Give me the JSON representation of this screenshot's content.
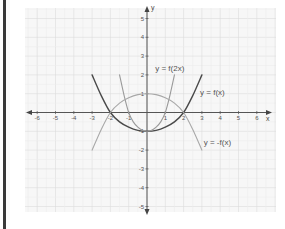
{
  "chart_data": {
    "type": "line",
    "title": "",
    "xlabel": "x",
    "ylabel": "y",
    "xlim": [
      -6.5,
      6.7
    ],
    "ylim": [
      -5.4,
      5.6
    ],
    "grid": true,
    "x_ticks": [
      -6,
      -5,
      -4,
      -3,
      -2,
      -1,
      1,
      2,
      3,
      4,
      5,
      6
    ],
    "y_ticks": [
      -5,
      -4,
      -3,
      -2,
      -1,
      1,
      2,
      3,
      4,
      5
    ],
    "series": [
      {
        "name": "y = f(x)",
        "color": "#4a4a4a",
        "width": 1.4,
        "points": [
          [
            -3,
            2
          ],
          [
            -2.5,
            0.9
          ],
          [
            -2,
            0
          ],
          [
            -1.5,
            -0.5
          ],
          [
            -1,
            -0.78
          ],
          [
            -0.5,
            -0.95
          ],
          [
            0,
            -1
          ],
          [
            0.5,
            -0.95
          ],
          [
            1,
            -0.78
          ],
          [
            1.5,
            -0.5
          ],
          [
            2,
            0
          ],
          [
            2.5,
            0.9
          ],
          [
            3,
            2
          ]
        ],
        "label_pos": [
          2.9,
          0.95
        ]
      },
      {
        "name": "y = f(2x)",
        "color": "#9a9a9a",
        "width": 1.1,
        "points": [
          [
            -1.5,
            2
          ],
          [
            -1.25,
            0.9
          ],
          [
            -1,
            0
          ],
          [
            -0.75,
            -0.5
          ],
          [
            -0.5,
            -0.78
          ],
          [
            -0.25,
            -0.95
          ],
          [
            0,
            -1
          ],
          [
            0.25,
            -0.95
          ],
          [
            0.5,
            -0.78
          ],
          [
            0.75,
            -0.5
          ],
          [
            1,
            0
          ],
          [
            1.25,
            0.9
          ],
          [
            1.5,
            2
          ]
        ],
        "label_pos": [
          0.45,
          2.2
        ]
      },
      {
        "name": "y = -f(x)",
        "color": "#a8a8a8",
        "width": 1.1,
        "points": [
          [
            -3,
            -2
          ],
          [
            -2.5,
            -0.9
          ],
          [
            -2,
            0
          ],
          [
            -1.5,
            0.5
          ],
          [
            -1,
            0.78
          ],
          [
            -0.5,
            0.95
          ],
          [
            0,
            1
          ],
          [
            0.5,
            0.95
          ],
          [
            1,
            0.78
          ],
          [
            1.5,
            0.5
          ],
          [
            2,
            0
          ],
          [
            2.5,
            -0.9
          ],
          [
            3,
            -2
          ]
        ],
        "label_pos": [
          3.1,
          -1.75
        ]
      }
    ]
  },
  "labels": {
    "x_axis": "x",
    "y_axis": "y",
    "f": "y = f(x)",
    "f2x": "y = f(2x)",
    "negf": "y = -f(x)"
  }
}
